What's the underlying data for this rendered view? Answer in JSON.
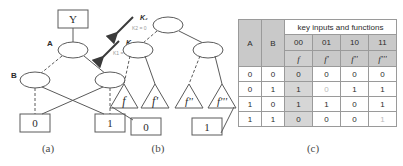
{
  "figure": {
    "panels": [
      {
        "id": "a",
        "caption": "(a)"
      },
      {
        "id": "b",
        "caption": "(b)"
      },
      {
        "id": "c",
        "caption": "(c)"
      }
    ]
  },
  "panel_a": {
    "root_box": "Y",
    "node_a_label": "A",
    "node_b_label": "B",
    "terminal_left": "0",
    "terminal_right": "1"
  },
  "panel_b": {
    "annotation_k2": "K₂",
    "annotation_k2_value": "K2 = 0",
    "annotation_k1": "K₁",
    "annotation_k1_value": "K1 = 0",
    "triangles": [
      "f",
      "f'",
      "f''",
      "f'''"
    ],
    "terminal_left": "0",
    "terminal_right": "1"
  },
  "panel_c": {
    "title": "key inputs and functions",
    "col_a": "A",
    "col_b": "B",
    "key_inputs": [
      "00",
      "01",
      "10",
      "11"
    ],
    "functions": [
      "f",
      "f'",
      "f''",
      "f'''"
    ],
    "rows": [
      {
        "a": "0",
        "b": "0",
        "f": "0",
        "f1": "0",
        "f2": "0",
        "f3": "0"
      },
      {
        "a": "0",
        "b": "1",
        "f": "1",
        "f1": "0",
        "f2": "1",
        "f3": "1"
      },
      {
        "a": "1",
        "b": "0",
        "f": "1",
        "f1": "1",
        "f2": "0",
        "f3": "1"
      },
      {
        "a": "1",
        "b": "1",
        "f": "0",
        "f1": "0",
        "f2": "0",
        "f3": "1"
      }
    ],
    "dim_cells": [
      "r1f1",
      "r3f3"
    ],
    "shaded_column": "00"
  },
  "colors": {
    "background": "#ffffff",
    "stroke": "#4a4a4a",
    "header_gray": "#c9c9c9",
    "shade_gray": "#cfcfcf",
    "text": "#2b2b2b"
  }
}
